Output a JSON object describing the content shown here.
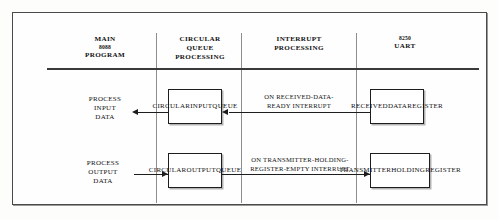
{
  "columns": [
    {
      "id": "main-program",
      "line1": "MAIN",
      "line2": "8088",
      "line3": "PROGRAM"
    },
    {
      "id": "queue-processing",
      "line1": "CIRCULAR",
      "line2": "QUEUE",
      "line3": "PROCESSING"
    },
    {
      "id": "interrupt-processing",
      "line1": "INTERRUPT",
      "line2": "PROCESSING",
      "line3": ""
    },
    {
      "id": "uart",
      "line1": "8250",
      "line2": "UART",
      "line3": ""
    }
  ],
  "boxes": {
    "circular_input_queue": "CIRCULAR\nINPUT\nQUEUE",
    "circular_output_queue": "CIRCULAR\nOUTPUT\nQUEUE",
    "received_data_register": "RECEIVED\nDATA\nREGISTER",
    "transmitter_holding_register": "TRANSMITTER\nHOLDING\nREGISTER"
  },
  "labels": {
    "process_input_data": "PROCESS\nINPUT\nDATA",
    "process_output_data": "PROCESS\nOUTPUT\nDATA",
    "received_data_ready_interrupt": "ON RECEIVED-DATA-\nREADY INTERRUPT",
    "transmitter_holding_empty_interrupt": "ON TRANSMITTER-HOLDING-\nREGISTER-EMPTY INTERRUPT"
  },
  "colors": {
    "ink": "#111111",
    "rule": "#1d1d1d",
    "divider": "#8e8e8e",
    "frame": "#4a4a4a",
    "background": "#fefefe"
  }
}
